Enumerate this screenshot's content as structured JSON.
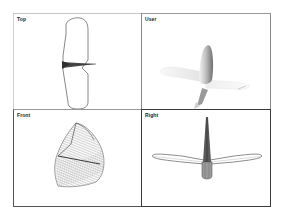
{
  "viewports": [
    {
      "id": "top",
      "label": "Top",
      "active": false,
      "render_mode": "wireframe-outline"
    },
    {
      "id": "user",
      "label": "User",
      "active": false,
      "render_mode": "shaded"
    },
    {
      "id": "front",
      "label": "Front",
      "active": false,
      "render_mode": "wireframe-mesh"
    },
    {
      "id": "right",
      "label": "Right",
      "active": true,
      "render_mode": "wireframe-outline"
    }
  ],
  "colors": {
    "active_border": "#333333",
    "inactive_border": "#b8b8b8",
    "background": "#ffffff",
    "wire": "#555555",
    "shade_dark": "#6a6a6a",
    "shade_light": "#eeeeee"
  },
  "model": {
    "object": "glider-airplane"
  }
}
